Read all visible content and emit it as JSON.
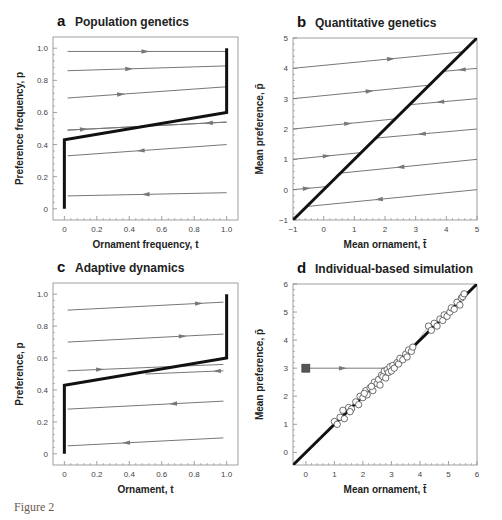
{
  "figure_label": "Figure 2",
  "colors": {
    "thin_line": "#777777",
    "thick_line": "#111111",
    "arrow": "#777777",
    "frame": "#888888",
    "marker_fill": "#ffffff",
    "start_marker": "#555555"
  },
  "chart_data": [
    {
      "id": "a",
      "letter": "a",
      "title": "Population genetics",
      "type": "line",
      "xlabel": "Ornament frequency, t",
      "ylabel": "Preference frequency, p",
      "xlim": [
        -0.07,
        1.07
      ],
      "ylim": [
        -0.07,
        1.07
      ],
      "xticks": [
        0,
        0.2,
        0.4,
        0.6,
        0.8,
        1.0
      ],
      "xtick_labels": [
        "0",
        "0.2",
        "0.4",
        "0.6",
        "0.8",
        "1.0"
      ],
      "yticks": [
        0,
        0.2,
        0.4,
        0.6,
        0.8,
        1.0
      ],
      "ytick_labels": [
        "0",
        "0.2",
        "0.4",
        "0.6",
        "0.8",
        "1.0"
      ],
      "frame_px": {
        "left": 53,
        "top": 37,
        "right": 238,
        "bottom": 220
      },
      "equilibrium_line": [
        [
          0,
          0
        ],
        [
          0,
          0.43
        ],
        [
          1,
          0.6
        ],
        [
          1,
          1.0
        ]
      ],
      "trajectories": [
        {
          "x": [
            0.02,
            1.0
          ],
          "y": [
            0.98,
            0.98
          ],
          "arrow_at": 0.5,
          "direction": "right"
        },
        {
          "x": [
            0.02,
            1.0
          ],
          "y": [
            0.86,
            0.89
          ],
          "arrow_at": 0.4,
          "direction": "right"
        },
        {
          "x": [
            0.02,
            1.0
          ],
          "y": [
            0.69,
            0.76
          ],
          "arrow_at": 0.35,
          "direction": "right"
        },
        {
          "x": [
            0.02,
            1.0
          ],
          "y": [
            0.49,
            0.54
          ],
          "arrow_at": 0.12,
          "direction": "right"
        },
        {
          "x": [
            0.02,
            1.0
          ],
          "y": [
            0.49,
            0.54
          ],
          "arrow_at": 0.89,
          "direction": "left"
        },
        {
          "x": [
            0.02,
            1.0
          ],
          "y": [
            0.33,
            0.4
          ],
          "arrow_at": 0.47,
          "direction": "left"
        },
        {
          "x": [
            0.02,
            1.0
          ],
          "y": [
            0.08,
            0.1
          ],
          "arrow_at": 0.5,
          "direction": "left"
        }
      ]
    },
    {
      "id": "b",
      "letter": "b",
      "title": "Quantitative genetics",
      "type": "line",
      "xlabel": "Mean ornament, t̄",
      "ylabel": "Mean preference, p̄",
      "xlim": [
        -1,
        5
      ],
      "ylim": [
        -1,
        5
      ],
      "xticks": [
        -1,
        0,
        1,
        2,
        3,
        4,
        5
      ],
      "xtick_labels": [
        "−1",
        "0",
        "1",
        "2",
        "3",
        "4",
        "5"
      ],
      "yticks": [
        -1,
        0,
        1,
        2,
        3,
        4,
        5
      ],
      "ytick_labels": [
        "−1",
        "0",
        "1",
        "2",
        "3",
        "4",
        "5"
      ],
      "frame_px": {
        "left": 293,
        "top": 38,
        "right": 477,
        "bottom": 220
      },
      "equilibrium_line": [
        [
          -1,
          -1
        ],
        [
          5,
          5
        ]
      ],
      "trajectories": [
        {
          "x": [
            -1,
            4.6
          ],
          "y": [
            4,
            4.55
          ],
          "arrow_at": 2.2,
          "direction": "right"
        },
        {
          "x": [
            3.9,
            5
          ],
          "y": [
            3.9,
            4.0
          ],
          "arrow_at": 4.5,
          "direction": "left"
        },
        {
          "x": [
            -1,
            3.5
          ],
          "y": [
            3,
            3.45
          ],
          "arrow_at": 1.5,
          "direction": "right"
        },
        {
          "x": [
            2.8,
            5
          ],
          "y": [
            2.8,
            3.0
          ],
          "arrow_at": 3.8,
          "direction": "left"
        },
        {
          "x": [
            -1,
            2.3
          ],
          "y": [
            2,
            2.33
          ],
          "arrow_at": 0.8,
          "direction": "right"
        },
        {
          "x": [
            1.7,
            5
          ],
          "y": [
            1.7,
            2.0
          ],
          "arrow_at": 3.2,
          "direction": "left"
        },
        {
          "x": [
            -1,
            1.2
          ],
          "y": [
            1,
            1.22
          ],
          "arrow_at": 0.1,
          "direction": "right"
        },
        {
          "x": [
            0.6,
            5
          ],
          "y": [
            0.55,
            1.0
          ],
          "arrow_at": 2.5,
          "direction": "left"
        },
        {
          "x": [
            -1,
            0.1
          ],
          "y": [
            0,
            0.1
          ],
          "arrow_at": -0.55,
          "direction": "right"
        },
        {
          "x": [
            -0.5,
            5
          ],
          "y": [
            -0.55,
            0
          ],
          "arrow_at": 1.8,
          "direction": "left"
        }
      ]
    },
    {
      "id": "c",
      "letter": "c",
      "title": "Adaptive dynamics",
      "type": "line",
      "xlabel": "Ornament, t",
      "ylabel": "Preference, p",
      "xlim": [
        -0.07,
        1.07
      ],
      "ylim": [
        -0.07,
        1.07
      ],
      "xticks": [
        0,
        0.2,
        0.4,
        0.6,
        0.8,
        1.0
      ],
      "xtick_labels": [
        "0",
        "0.2",
        "0.4",
        "0.6",
        "0.8",
        "1.0"
      ],
      "yticks": [
        0,
        0.2,
        0.4,
        0.6,
        0.8,
        1.0
      ],
      "ytick_labels": [
        "0",
        "0.2",
        "0.4",
        "0.6",
        "0.8",
        "1.0"
      ],
      "frame_px": {
        "left": 53,
        "top": 283,
        "right": 238,
        "bottom": 465
      },
      "equilibrium_line": [
        [
          0,
          0
        ],
        [
          0,
          0.43
        ],
        [
          1,
          0.6
        ],
        [
          1,
          1.0
        ]
      ],
      "trajectories": [
        {
          "x": [
            0.02,
            0.98
          ],
          "y": [
            0.9,
            0.95
          ],
          "arrow_at": 0.83,
          "direction": "right"
        },
        {
          "x": [
            0.02,
            0.98
          ],
          "y": [
            0.7,
            0.75
          ],
          "arrow_at": 0.73,
          "direction": "right"
        },
        {
          "x": [
            0.02,
            0.98
          ],
          "y": [
            0.52,
            0.56
          ],
          "arrow_at": 0.22,
          "direction": "right"
        },
        {
          "x": [
            0.5,
            0.98
          ],
          "y": [
            0.5,
            0.52
          ],
          "arrow_at": 0.94,
          "direction": "left"
        },
        {
          "x": [
            0.02,
            0.98
          ],
          "y": [
            0.28,
            0.33
          ],
          "arrow_at": 0.67,
          "direction": "left"
        },
        {
          "x": [
            0.02,
            0.98
          ],
          "y": [
            0.05,
            0.1
          ],
          "arrow_at": 0.38,
          "direction": "left"
        }
      ]
    },
    {
      "id": "d",
      "letter": "d",
      "title": "Individual-based simulation",
      "type": "scatter",
      "xlabel": "Mean ornament, t̄",
      "ylabel": "Mean preference, p̄",
      "xlim": [
        -0.45,
        6
      ],
      "ylim": [
        -0.45,
        6
      ],
      "xticks": [
        0,
        1,
        2,
        3,
        4,
        5,
        6
      ],
      "xtick_labels": [
        "0",
        "1",
        "2",
        "3",
        "4",
        "5",
        "6"
      ],
      "yticks": [
        0,
        1,
        2,
        3,
        4,
        5,
        6
      ],
      "ytick_labels": [
        "0",
        "1",
        "2",
        "3",
        "4",
        "5",
        "6"
      ],
      "frame_px": {
        "left": 293,
        "top": 284,
        "right": 477,
        "bottom": 465
      },
      "equilibrium_line": [
        [
          -0.45,
          -0.45
        ],
        [
          6,
          6
        ]
      ],
      "start_point": {
        "x": 0,
        "y": 3
      },
      "initial_trajectory": {
        "x": [
          0,
          2.75
        ],
        "y": [
          3,
          3
        ],
        "arrow_at": 1.3,
        "direction": "right"
      },
      "scatter_points": [
        [
          1.0,
          1.1
        ],
        [
          1.1,
          1.0
        ],
        [
          1.2,
          1.25
        ],
        [
          1.3,
          1.5
        ],
        [
          1.35,
          1.2
        ],
        [
          1.5,
          1.6
        ],
        [
          1.6,
          1.55
        ],
        [
          1.75,
          1.8
        ],
        [
          1.85,
          1.7
        ],
        [
          1.9,
          2.0
        ],
        [
          2.0,
          1.95
        ],
        [
          2.1,
          2.2
        ],
        [
          2.15,
          2.05
        ],
        [
          2.25,
          2.3
        ],
        [
          2.35,
          2.2
        ],
        [
          2.4,
          2.5
        ],
        [
          2.5,
          2.45
        ],
        [
          2.55,
          2.6
        ],
        [
          2.6,
          2.4
        ],
        [
          2.65,
          2.75
        ],
        [
          2.7,
          2.7
        ],
        [
          2.75,
          2.9
        ],
        [
          2.8,
          2.65
        ],
        [
          2.85,
          2.95
        ],
        [
          2.9,
          2.85
        ],
        [
          2.95,
          3.05
        ],
        [
          3.0,
          2.9
        ],
        [
          3.05,
          3.1
        ],
        [
          3.1,
          3.0
        ],
        [
          3.2,
          3.2
        ],
        [
          3.25,
          3.15
        ],
        [
          3.3,
          3.35
        ],
        [
          3.4,
          3.3
        ],
        [
          3.5,
          3.5
        ],
        [
          3.55,
          3.4
        ],
        [
          3.6,
          3.65
        ],
        [
          3.7,
          3.6
        ],
        [
          3.75,
          3.75
        ],
        [
          4.3,
          4.5
        ],
        [
          4.4,
          4.35
        ],
        [
          4.5,
          4.6
        ],
        [
          4.6,
          4.5
        ],
        [
          4.7,
          4.75
        ],
        [
          4.8,
          4.7
        ],
        [
          4.85,
          4.9
        ],
        [
          4.95,
          4.85
        ],
        [
          5.05,
          5.0
        ],
        [
          5.1,
          5.15
        ],
        [
          5.2,
          5.1
        ],
        [
          5.3,
          5.35
        ],
        [
          5.4,
          5.25
        ],
        [
          5.45,
          5.5
        ],
        [
          5.5,
          5.55
        ],
        [
          5.55,
          5.65
        ],
        [
          2.3,
          2.35
        ],
        [
          1.55,
          1.45
        ],
        [
          2.05,
          2.1
        ]
      ]
    }
  ]
}
